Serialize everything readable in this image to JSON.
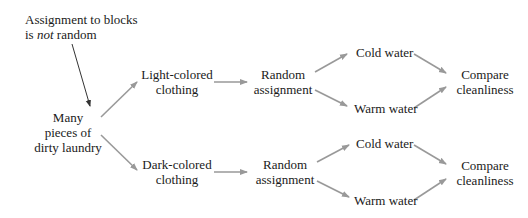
{
  "diagram": {
    "type": "flowchart",
    "colors": {
      "text": "#1a1a1a",
      "arrow": "#999999",
      "note_arrow": "#333333",
      "background": "#ffffff"
    },
    "note": {
      "line1": "Assignment to blocks",
      "line2_prefix": "is ",
      "line2_italic": "not",
      "line2_suffix": " random"
    },
    "source": {
      "line1": "Many",
      "line2": "pieces of",
      "line3": "dirty laundry"
    },
    "blocks": [
      {
        "label_line1": "Light-colored",
        "label_line2": "clothing",
        "assignment_line1": "Random",
        "assignment_line2": "assignment",
        "treatments": [
          "Cold water",
          "Warm water"
        ],
        "outcome_line1": "Compare",
        "outcome_line2": "cleanliness"
      },
      {
        "label_line1": "Dark-colored",
        "label_line2": "clothing",
        "assignment_line1": "Random",
        "assignment_line2": "assignment",
        "treatments": [
          "Cold water",
          "Warm water"
        ],
        "outcome_line1": "Compare",
        "outcome_line2": "cleanliness"
      }
    ]
  }
}
